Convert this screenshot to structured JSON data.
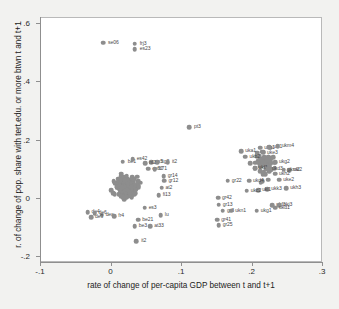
{
  "chart_data": {
    "type": "scatter",
    "title": "",
    "xlabel": "rate of change of per-capita GDP between t and t+1",
    "ylabel": "r. of change of pop. share with tert.edu. or more btwn t and t+1",
    "xlim": [
      -0.1,
      0.3
    ],
    "ylim": [
      -0.22,
      0.62
    ],
    "xticks": [
      -0.1,
      0,
      0.1,
      0.2,
      0.3
    ],
    "xticklabels": [
      "-.1",
      "0",
      ".1",
      ".2",
      ".3"
    ],
    "yticks": [
      -0.2,
      0,
      0.2,
      0.4,
      0.6
    ],
    "yticklabels": [
      "-.2",
      "0",
      ".2",
      ".4",
      ".6"
    ],
    "grid": false,
    "legend": false,
    "marker_color": "#8d8d8d",
    "label_color": "#4a4a4a",
    "plot_bg": "#ffffff",
    "figure_bg": "#f2f2f0",
    "axis_color": "#8f8f8f",
    "points": [
      {
        "x": -0.012,
        "y": 0.536,
        "label": "se06",
        "lx": 5,
        "ly": 0
      },
      {
        "x": 0.033,
        "y": 0.532,
        "label": "frj3",
        "lx": 5,
        "ly": 0
      },
      {
        "x": 0.033,
        "y": 0.514,
        "label": "es23",
        "lx": 5,
        "ly": 0
      },
      {
        "x": 0.11,
        "y": 0.245,
        "label": "pt3",
        "lx": 5,
        "ly": 0
      },
      {
        "x": 0.035,
        "y": -0.145,
        "label": "it2",
        "lx": 5,
        "ly": 0
      },
      {
        "x": 0.016,
        "y": 0.128,
        "label": "be1",
        "lx": 5,
        "ly": 0
      },
      {
        "x": 0.03,
        "y": 0.136,
        "label": "es42",
        "lx": 4,
        "ly": 0
      },
      {
        "x": 0.056,
        "y": 0.125,
        "label": "es5",
        "lx": 4,
        "ly": 0
      },
      {
        "x": 0.065,
        "y": 0.126,
        "label": "itg2",
        "lx": 4,
        "ly": 0
      },
      {
        "x": 0.08,
        "y": 0.126,
        "label": "it2",
        "lx": 4,
        "ly": 0
      },
      {
        "x": 0.048,
        "y": 0.122,
        "label": "nl2",
        "lx": 4,
        "ly": 0
      },
      {
        "x": 0.052,
        "y": 0.104,
        "label": "es62",
        "lx": 4,
        "ly": 0
      },
      {
        "x": 0.061,
        "y": 0.101,
        "label": "fr71",
        "lx": 4,
        "ly": 0
      },
      {
        "x": 0.074,
        "y": 0.078,
        "label": "gr14",
        "lx": 4,
        "ly": 0
      },
      {
        "x": 0.075,
        "y": 0.062,
        "label": "gr12",
        "lx": 4,
        "ly": 0
      },
      {
        "x": 0.071,
        "y": 0.038,
        "label": "at2",
        "lx": 4,
        "ly": 0
      },
      {
        "x": 0.067,
        "y": 0.012,
        "label": "fi13",
        "lx": 4,
        "ly": 0
      },
      {
        "x": 0.07,
        "y": -0.056,
        "label": "lu",
        "lx": 4,
        "ly": 0
      },
      {
        "x": 0.047,
        "y": -0.03,
        "label": "es3",
        "lx": 4,
        "ly": 0
      },
      {
        "x": 0.038,
        "y": -0.072,
        "label": "be21",
        "lx": 4,
        "ly": 0
      },
      {
        "x": 0.033,
        "y": -0.093,
        "label": "be3",
        "lx": 4,
        "ly": 0
      },
      {
        "x": 0.055,
        "y": -0.094,
        "label": "at33",
        "lx": 4,
        "ly": 0
      },
      {
        "x": -0.034,
        "y": -0.046,
        "label": "de4",
        "lx": 4,
        "ly": 0
      },
      {
        "x": -0.024,
        "y": -0.05,
        "label": "de6",
        "lx": 4,
        "ly": 0
      },
      {
        "x": -0.014,
        "y": -0.054,
        "label": "dea",
        "lx": 4,
        "ly": 0
      },
      {
        "x": -0.029,
        "y": -0.062,
        "label": "de9",
        "lx": 4,
        "ly": 0
      },
      {
        "x": 0.004,
        "y": -0.059,
        "label": "fr4",
        "lx": 4,
        "ly": 0
      },
      {
        "x": 0.184,
        "y": 0.163,
        "label": "uka1",
        "lx": 4,
        "ly": 0
      },
      {
        "x": 0.19,
        "y": 0.144,
        "label": "ukb2",
        "lx": 4,
        "ly": 0
      },
      {
        "x": 0.211,
        "y": 0.175,
        "label": "ukk1",
        "lx": 4,
        "ly": 0
      },
      {
        "x": 0.224,
        "y": 0.178,
        "label": "ukl1",
        "lx": 4,
        "ly": 0
      },
      {
        "x": 0.236,
        "y": 0.18,
        "label": "ukm4",
        "lx": 4,
        "ly": 0
      },
      {
        "x": 0.215,
        "y": 0.158,
        "label": "uke3",
        "lx": 4,
        "ly": 0
      },
      {
        "x": 0.232,
        "y": 0.126,
        "label": "ukg2",
        "lx": 4,
        "ly": 0
      },
      {
        "x": 0.203,
        "y": 0.105,
        "label": "ukf1",
        "lx": 4,
        "ly": 0
      },
      {
        "x": 0.222,
        "y": 0.104,
        "label": "ukd3",
        "lx": 4,
        "ly": 0
      },
      {
        "x": 0.252,
        "y": 0.098,
        "label": "uki2",
        "lx": 4,
        "ly": 0
      },
      {
        "x": 0.244,
        "y": 0.1,
        "label": "ukm2",
        "lx": 4,
        "ly": 0
      },
      {
        "x": 0.232,
        "y": 0.086,
        "label": "ukh2",
        "lx": 4,
        "ly": 0
      },
      {
        "x": 0.238,
        "y": 0.066,
        "label": "uke2",
        "lx": 4,
        "ly": 0
      },
      {
        "x": 0.248,
        "y": 0.036,
        "label": "ukh3",
        "lx": 4,
        "ly": 0
      },
      {
        "x": 0.221,
        "y": 0.034,
        "label": "ukk3",
        "lx": 4,
        "ly": 0
      },
      {
        "x": 0.208,
        "y": 0.03,
        "label": "uki1",
        "lx": 4,
        "ly": 0
      },
      {
        "x": 0.192,
        "y": 0.028,
        "label": "ukc2",
        "lx": 4,
        "ly": 0
      },
      {
        "x": 0.195,
        "y": 0.062,
        "label": "ukd4",
        "lx": 4,
        "ly": 0
      },
      {
        "x": 0.165,
        "y": 0.062,
        "label": "gr22",
        "lx": 4,
        "ly": 0
      },
      {
        "x": 0.228,
        "y": -0.022,
        "label": "ukf3",
        "lx": 4,
        "ly": 0
      },
      {
        "x": 0.238,
        "y": -0.022,
        "label": "ukj3",
        "lx": 4,
        "ly": 0
      },
      {
        "x": 0.232,
        "y": -0.03,
        "label": "ukd1",
        "lx": 4,
        "ly": 0
      },
      {
        "x": 0.206,
        "y": -0.04,
        "label": "ukg1",
        "lx": 4,
        "ly": 0
      },
      {
        "x": 0.151,
        "y": 0.004,
        "label": "gr42",
        "lx": 4,
        "ly": 0
      },
      {
        "x": 0.152,
        "y": -0.02,
        "label": "gr13",
        "lx": 4,
        "ly": 0
      },
      {
        "x": 0.158,
        "y": -0.04,
        "label": "gr3",
        "lx": 4,
        "ly": 0
      },
      {
        "x": 0.17,
        "y": -0.04,
        "label": "ukn1",
        "lx": 4,
        "ly": 0
      },
      {
        "x": 0.15,
        "y": -0.072,
        "label": "gr41",
        "lx": 4,
        "ly": 0
      },
      {
        "x": 0.152,
        "y": -0.09,
        "label": "gr25",
        "lx": 4,
        "ly": 0
      }
    ],
    "cluster_main": {
      "note": "dense unlabeled gray cloud",
      "center": [
        0.022,
        0.042
      ],
      "count": 260
    },
    "cluster_right": {
      "note": "dense gray cloud of UK regions",
      "center": [
        0.218,
        0.115
      ],
      "count": 70
    }
  }
}
